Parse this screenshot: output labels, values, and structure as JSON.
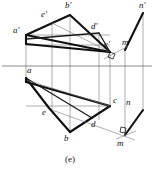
{
  "figure": {
    "caption": "(e)",
    "colors": {
      "stroke_heavy": "#111111",
      "stroke_medium": "#1a1a1a",
      "stroke_light": "#777777",
      "axis": "#6d6d6d",
      "background": "#ffffff",
      "label": "#101010"
    },
    "front_view": {
      "name": "frontal-projection",
      "labels": [
        {
          "id": "a-prime",
          "text": "a′",
          "x": 13,
          "y": 33
        },
        {
          "id": "b-prime",
          "text": "b′",
          "x": 65,
          "y": 8
        },
        {
          "id": "c-prime",
          "text": "c′",
          "x": 104,
          "y": 47
        },
        {
          "id": "d-prime",
          "text": "d′",
          "x": 91,
          "y": 29
        },
        {
          "id": "e-prime",
          "text": "e′",
          "x": 41,
          "y": 17
        },
        {
          "id": "m-prime",
          "text": "m′",
          "x": 122,
          "y": 45
        },
        {
          "id": "n-prime",
          "text": "n′",
          "x": 139,
          "y": 8
        }
      ],
      "vertices": {
        "a_prime": [
          26,
          35
        ],
        "b_prime": [
          70,
          15
        ],
        "c_prime": [
          110,
          52
        ],
        "d_prime": [
          99,
          33
        ],
        "e_prime": [
          52,
          23
        ],
        "m_prime": [
          125,
          50
        ],
        "n_prime": [
          143,
          13
        ]
      }
    },
    "top_view": {
      "name": "horizontal-projection",
      "labels": [
        {
          "id": "a",
          "text": "a",
          "x": 27,
          "y": 73
        },
        {
          "id": "b",
          "text": "b",
          "x": 64,
          "y": 137
        },
        {
          "id": "c",
          "text": "c",
          "x": 113,
          "y": 101
        },
        {
          "id": "d",
          "text": "d",
          "x": 91,
          "y": 124
        },
        {
          "id": "e",
          "text": "e",
          "x": 42,
          "y": 112
        },
        {
          "id": "m",
          "text": "m",
          "x": 117,
          "y": 140
        },
        {
          "id": "n",
          "text": "n",
          "x": 126,
          "y": 101
        }
      ],
      "vertices": {
        "a": [
          26,
          78
        ],
        "b": [
          70,
          132
        ],
        "c": [
          110,
          106
        ],
        "d": [
          92,
          118
        ],
        "e": [
          49,
          108
        ],
        "m": [
          125,
          135
        ],
        "n": [
          143,
          110
        ]
      }
    },
    "ground_line": {
      "name": "xy-axis",
      "y": 66,
      "x_start": 2,
      "x_end": 152
    },
    "right_angle_markers": [
      {
        "id": "right-angle-front",
        "x": 111,
        "y": 53
      },
      {
        "id": "right-angle-top",
        "x": 124,
        "y": 128
      }
    ]
  }
}
